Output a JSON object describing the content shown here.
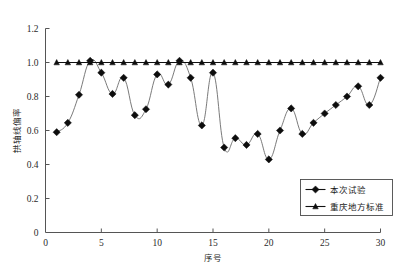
{
  "chart_data": {
    "type": "line",
    "title": "",
    "xlabel": "序号",
    "ylabel": "拱轴线偏率",
    "xlim": [
      0,
      30
    ],
    "ylim": [
      0,
      1.2
    ],
    "xticks": [
      "0",
      "5",
      "10",
      "15",
      "20",
      "25",
      "30"
    ],
    "xtick_values": [
      0,
      5,
      10,
      15,
      20,
      25,
      30
    ],
    "yticks": [
      "0",
      "0.2",
      "0.4",
      "0.6",
      "0.8",
      "1.0",
      "1.2"
    ],
    "ytick_values": [
      0,
      0.2,
      0.4,
      0.6,
      0.8,
      1.0,
      1.2
    ],
    "grid": false,
    "legend_position": "bottom-right",
    "x": [
      1,
      2,
      3,
      4,
      5,
      6,
      7,
      8,
      9,
      10,
      11,
      12,
      13,
      14,
      15,
      16,
      17,
      18,
      19,
      20,
      21,
      22,
      23,
      24,
      25,
      26,
      27,
      28,
      29,
      30
    ],
    "series": [
      {
        "name": "本次试验",
        "marker": "diamond",
        "color": "#0d0d0d",
        "values": [
          0.59,
          0.645,
          0.81,
          1.01,
          0.94,
          0.815,
          0.91,
          0.69,
          0.725,
          0.93,
          0.87,
          1.01,
          0.91,
          0.63,
          0.94,
          0.5,
          0.555,
          0.515,
          0.58,
          0.43,
          0.6,
          0.73,
          0.58,
          0.645,
          0.7,
          0.75,
          0.8,
          0.86,
          0.75,
          0.91
        ]
      },
      {
        "name": "重庆地方标准",
        "marker": "triangle",
        "color": "#0d0d0d",
        "values": [
          1.0,
          1.0,
          1.0,
          1.0,
          1.0,
          1.0,
          1.0,
          1.0,
          1.0,
          1.0,
          1.0,
          1.0,
          1.0,
          1.0,
          1.0,
          1.0,
          1.0,
          1.0,
          1.0,
          1.0,
          1.0,
          1.0,
          1.0,
          1.0,
          1.0,
          1.0,
          1.0,
          1.0,
          1.0,
          1.0
        ]
      }
    ]
  },
  "legend": {
    "entries": [
      {
        "label": "本次试验"
      },
      {
        "label": "重庆地方标准"
      }
    ]
  },
  "axes": {
    "x_title": "序号",
    "y_title": "拱轴线偏率"
  }
}
